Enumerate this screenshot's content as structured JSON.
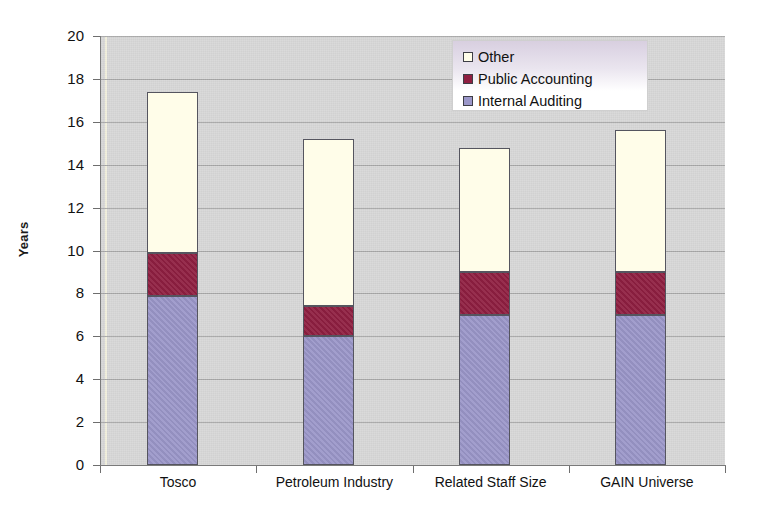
{
  "chart_data": {
    "type": "bar",
    "subtype": "stacked-bar",
    "title": "",
    "xlabel": "",
    "ylabel": "Years",
    "ylim": [
      0,
      20
    ],
    "yticks": [
      0,
      2,
      4,
      6,
      8,
      10,
      12,
      14,
      16,
      18,
      20
    ],
    "grid": true,
    "legend_position": "top-right",
    "categories": [
      "Tosco",
      "Petroleum Industry",
      "Related Staff Size",
      "GAIN Universe"
    ],
    "series": [
      {
        "name": "Internal Auditing",
        "color": "#9b97c9",
        "values": [
          7.9,
          6.0,
          7.0,
          7.0
        ]
      },
      {
        "name": "Public Accounting",
        "color": "#8f1f41",
        "values": [
          2.0,
          1.4,
          2.0,
          2.0
        ]
      },
      {
        "name": "Other",
        "color": "#fffde9",
        "values": [
          7.5,
          7.8,
          5.8,
          6.6
        ]
      }
    ],
    "totals": [
      17.4,
      15.2,
      14.8,
      15.6
    ],
    "cumulative_tops": [
      [
        7.9,
        9.9,
        17.4
      ],
      [
        6.0,
        7.4,
        15.2
      ],
      [
        7.0,
        9.0,
        14.8
      ],
      [
        7.0,
        9.0,
        15.6
      ]
    ]
  },
  "axis": {
    "y_title": "Years",
    "y_tick_labels": [
      "20",
      "18",
      "16",
      "14",
      "12",
      "10",
      "8",
      "6",
      "4",
      "2",
      "0"
    ],
    "x_tick_labels": [
      "Tosco",
      "Petroleum Industry",
      "Related Staff Size",
      "GAIN Universe"
    ]
  },
  "legend": {
    "items": [
      {
        "label": "Other",
        "color": "#fffde9"
      },
      {
        "label": "Public Accounting",
        "color": "#8f1f41"
      },
      {
        "label": "Internal Auditing",
        "color": "#9b97c9"
      }
    ]
  },
  "colors": {
    "plot_background": "#d6d6d6",
    "gridline": "#a6a6a6",
    "axis": "#7a7a7a",
    "internal_auditing": "#9b97c9",
    "public_accounting": "#8f1f41",
    "other": "#fffde9",
    "text": "#111111"
  }
}
